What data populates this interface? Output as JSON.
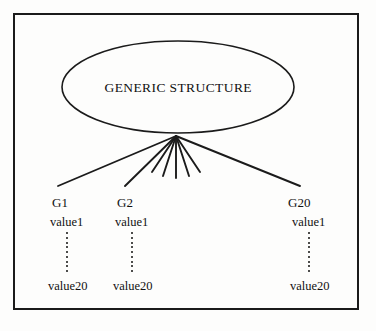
{
  "diagram": {
    "title_node": {
      "label": "GENERIC STRUCTURE",
      "shape": "ellipse",
      "center_x": 178,
      "center_y": 87,
      "rx": 116,
      "ry": 46
    },
    "hub": {
      "x": 176,
      "y": 136,
      "name": "fan-convergence-point"
    },
    "edges": [
      {
        "name": "edge-to-g1",
        "x2": 58,
        "y2": 186
      },
      {
        "name": "edge-to-g2",
        "x2": 125,
        "y2": 186
      },
      {
        "name": "edge-short-1",
        "x2": 152,
        "y2": 172
      },
      {
        "name": "edge-short-2",
        "x2": 163,
        "y2": 176
      },
      {
        "name": "edge-short-3",
        "x2": 176,
        "y2": 178
      },
      {
        "name": "edge-short-4",
        "x2": 189,
        "y2": 176
      },
      {
        "name": "edge-short-5",
        "x2": 200,
        "y2": 172
      },
      {
        "name": "edge-to-g20",
        "x2": 300,
        "y2": 186
      }
    ],
    "columns": [
      {
        "name": "column-g1",
        "group_label": "G1",
        "first_value": "value1",
        "last_value": "value20",
        "x": 52,
        "value_x": 50,
        "dots_x": 66,
        "last_x": 48
      },
      {
        "name": "column-g2",
        "group_label": "G2",
        "first_value": "value1",
        "last_value": "value20",
        "x": 117,
        "value_x": 115,
        "dots_x": 131,
        "last_x": 113
      },
      {
        "name": "column-g20",
        "group_label": "G20",
        "first_value": "value1",
        "last_value": "value20",
        "x": 288,
        "value_x": 292,
        "dots_x": 308,
        "last_x": 290
      }
    ],
    "rows": {
      "group_label_y": 196,
      "first_value_y": 216,
      "dots_top_y": 232,
      "dots_bottom_y": 272,
      "last_value_y": 280
    },
    "colors": {
      "stroke": "#1b1b1b",
      "text": "#111111",
      "background": "#fdfdfc"
    }
  }
}
